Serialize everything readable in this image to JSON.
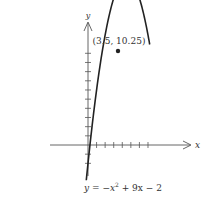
{
  "chart_data": {
    "type": "line",
    "title": "",
    "equation": "y = −x² + 9x − 2",
    "equation_parts": {
      "lhs": "y = −x",
      "exp": "2",
      "rhs": " + 9x − 2"
    },
    "xlabel": "x",
    "ylabel": "y",
    "vertex": {
      "x": 3.5,
      "y": 10.25,
      "label": "(3.5, 10.25)"
    },
    "coefficients": {
      "a": -1,
      "b": 9,
      "c": -2
    },
    "xlim": [
      -4.5,
      11.5
    ],
    "ylim": [
      -3.5,
      13
    ],
    "x_ticks": [
      1,
      2,
      3,
      4,
      5,
      6,
      7
    ],
    "y_ticks": [
      -2,
      -1,
      1,
      2,
      3,
      4,
      5,
      6,
      7,
      8,
      9,
      10
    ],
    "curve_x_range": [
      -0.2,
      7.2
    ],
    "grid": false,
    "legend": "none"
  },
  "colors": {
    "axis": "#555555",
    "curve": "#222222",
    "text": "#333333"
  }
}
